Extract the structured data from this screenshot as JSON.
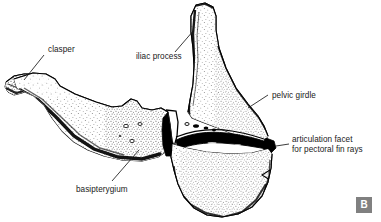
{
  "figure": {
    "panel_badge": "B",
    "badge_color": "#808080",
    "ink_color": "#000000",
    "background_color": "#ffffff",
    "labels": [
      {
        "id": "clasper",
        "text": "clasper",
        "x": 48,
        "y": 50
      },
      {
        "id": "iliac-process",
        "text": "iliac process",
        "x": 136,
        "y": 57
      },
      {
        "id": "pelvic-girdle",
        "text": "pelvic girdle",
        "x": 272,
        "y": 96
      },
      {
        "id": "articulation-facet",
        "text": "articulation facet",
        "x": 292,
        "y": 140
      },
      {
        "id": "articulation-facet-line2",
        "text": "for pectoral fin rays",
        "x": 292,
        "y": 150
      },
      {
        "id": "basipterygium",
        "text": "basipterygium",
        "x": 76,
        "y": 190
      }
    ],
    "structures": [
      {
        "id": "clasper",
        "description": "pointed anterior spur of the basipterygium"
      },
      {
        "id": "basipterygium",
        "description": "elongate horizontal basal plate of the pelvic fin skeleton"
      },
      {
        "id": "iliac-process",
        "description": "tall dorsally directed blade of the pelvic girdle"
      },
      {
        "id": "pelvic-girdle",
        "description": "broad plate-like element posterior to the basipterygium"
      },
      {
        "id": "articulation-facet",
        "description": "dark horizontal groove for pectoral fin ray attachment"
      }
    ]
  }
}
